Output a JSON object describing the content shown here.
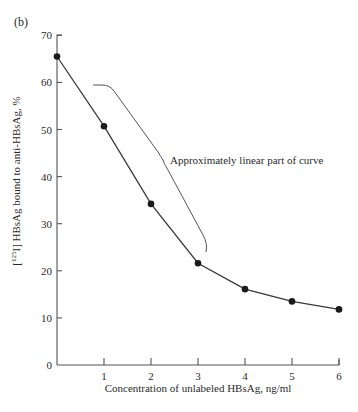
{
  "panel_label": "(b)",
  "chart_data": {
    "type": "line",
    "title": "",
    "xlabel": "Concentration of unlabeled HBsAg, ng/ml",
    "ylabel": "[125I] HBsAg bound to anti-HBsAg, %",
    "x": [
      0,
      1,
      2,
      3,
      4,
      5,
      6
    ],
    "series": [
      {
        "name": "[125I] HBsAg bound",
        "values": [
          65.5,
          50.7,
          34.2,
          21.6,
          16.1,
          13.5,
          11.8
        ],
        "marker": "filled-circle",
        "color": "#1a1a1a"
      }
    ],
    "xlim": [
      0,
      6
    ],
    "ylim": [
      0,
      70
    ],
    "x_ticks": [
      "1",
      "2",
      "3",
      "4",
      "5",
      "6"
    ],
    "y_ticks": [
      "0",
      "10",
      "20",
      "30",
      "40",
      "50",
      "60",
      "70"
    ],
    "grid": false,
    "legend": null,
    "annotations": [
      {
        "text": "Approximately linear part of curve",
        "type": "brace",
        "spans_x": [
          1,
          3
        ]
      }
    ]
  }
}
